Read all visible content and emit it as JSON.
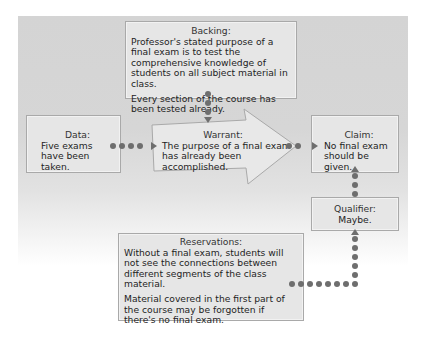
{
  "diagram": {
    "type": "Toulmin argument model",
    "colors": {
      "panel": "#d6d6d6",
      "box": "#e6e6e6",
      "border": "#a9a9a9",
      "connector": "#6e6e6e",
      "text": "#1e1e1e"
    },
    "backing": {
      "label": "Backing:",
      "paragraphs": [
        "Professor's stated purpose of a final exam is to test the comprehensive knowledge of students on all subject material in class.",
        "Every section of the course has been tested already."
      ]
    },
    "data": {
      "label": "Data:",
      "text": "Five exams have been taken."
    },
    "warrant": {
      "label": "Warrant:",
      "text": "The purpose of a final exam has already been accomplished."
    },
    "claim": {
      "label": "Claim:",
      "text": "No final exam should be given."
    },
    "qualifier": {
      "label": "Qualifier:",
      "text": "Maybe."
    },
    "reservations": {
      "label": "Reservations:",
      "paragraphs": [
        "Without a final exam, students will not see the connections between different segments of the class material.",
        "Material covered in the first part of the course may be forgotten if there's no final exam."
      ]
    },
    "connectors": [
      {
        "from": "data",
        "to": "warrant",
        "style": "dotted-arrow"
      },
      {
        "from": "backing",
        "to": "warrant",
        "style": "dotted-arrow"
      },
      {
        "from": "warrant",
        "to": "claim",
        "style": "dotted-arrow"
      },
      {
        "from": "qualifier",
        "to": "claim",
        "style": "dotted-arrow"
      },
      {
        "from": "reservations",
        "to": "qualifier",
        "style": "dotted-arrow"
      }
    ]
  }
}
